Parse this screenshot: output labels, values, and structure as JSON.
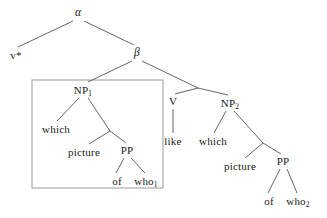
{
  "diagram": {
    "type": "syntax-tree",
    "width": 327,
    "height": 218,
    "background_color": "#ffffff",
    "line_color": "#555555",
    "box_color": "#999999",
    "text_color": "#1a1a1a"
  },
  "nodes": {
    "alpha": {
      "label": "α",
      "x": 78,
      "y": 13
    },
    "v_star": {
      "label": "v*",
      "x": 16,
      "y": 55
    },
    "beta": {
      "label": "β",
      "x": 137,
      "y": 53
    },
    "np1": {
      "label": "NP",
      "sub": "1",
      "x": 83,
      "y": 90
    },
    "which_left": {
      "label": "which",
      "x": 56,
      "y": 129
    },
    "picture_left": {
      "label": "picture",
      "x": 84,
      "y": 152
    },
    "pp_left": {
      "label": "PP",
      "x": 127,
      "y": 150
    },
    "of_left": {
      "label": "of",
      "x": 117,
      "y": 181
    },
    "who1": {
      "label": "who",
      "sub": "1",
      "x": 146,
      "y": 181
    },
    "v": {
      "label": "V",
      "x": 173,
      "y": 101
    },
    "like": {
      "label": "like",
      "x": 173,
      "y": 141
    },
    "np2": {
      "label": "NP",
      "sub": "2",
      "x": 230,
      "y": 103
    },
    "which_right": {
      "label": "which",
      "x": 213,
      "y": 141
    },
    "picture_right": {
      "label": "picture",
      "x": 240,
      "y": 166
    },
    "pp_right": {
      "label": "PP",
      "x": 283,
      "y": 161
    },
    "of_right": {
      "label": "of",
      "x": 269,
      "y": 201
    },
    "who2": {
      "label": "who",
      "sub": "2",
      "x": 298,
      "y": 201
    }
  },
  "edges": [
    {
      "from": "alpha",
      "to": "v_star",
      "x1": 73,
      "y1": 21,
      "x2": 18,
      "y2": 47
    },
    {
      "from": "alpha",
      "to": "beta",
      "x1": 84,
      "y1": 21,
      "x2": 134,
      "y2": 45
    },
    {
      "from": "beta",
      "to": "np1",
      "x1": 132,
      "y1": 61,
      "x2": 88,
      "y2": 82
    },
    {
      "from": "beta",
      "to": "vp",
      "x1": 142,
      "y1": 61,
      "x2": 198,
      "y2": 88
    },
    {
      "from": "vp",
      "to": "v",
      "x1": 198,
      "y1": 88,
      "x2": 175,
      "y2": 94
    },
    {
      "from": "vp",
      "to": "np2",
      "x1": 198,
      "y1": 88,
      "x2": 228,
      "y2": 95
    },
    {
      "from": "np1",
      "to": "which_left",
      "x1": 79,
      "y1": 98,
      "x2": 57,
      "y2": 121
    },
    {
      "from": "np1",
      "to": "nbar_left",
      "x1": 88,
      "y1": 98,
      "x2": 110,
      "y2": 131
    },
    {
      "from": "nbar_left",
      "to": "picture_left",
      "x1": 110,
      "y1": 131,
      "x2": 89,
      "y2": 144
    },
    {
      "from": "nbar_left",
      "to": "pp_left",
      "x1": 110,
      "y1": 131,
      "x2": 126,
      "y2": 143
    },
    {
      "from": "pp_left",
      "to": "of_left",
      "x1": 124,
      "y1": 158,
      "x2": 116,
      "y2": 173
    },
    {
      "from": "pp_left",
      "to": "who1",
      "x1": 131,
      "y1": 158,
      "x2": 145,
      "y2": 173
    },
    {
      "from": "v",
      "to": "like",
      "x1": 173,
      "y1": 109,
      "x2": 173,
      "y2": 133
    },
    {
      "from": "np2",
      "to": "which_right",
      "x1": 226,
      "y1": 111,
      "x2": 214,
      "y2": 133
    },
    {
      "from": "np2",
      "to": "nbar_right",
      "x1": 234,
      "y1": 111,
      "x2": 263,
      "y2": 143
    },
    {
      "from": "nbar_right",
      "to": "picture_right",
      "x1": 263,
      "y1": 143,
      "x2": 245,
      "y2": 158
    },
    {
      "from": "nbar_right",
      "to": "pp_right",
      "x1": 263,
      "y1": 143,
      "x2": 281,
      "y2": 154
    },
    {
      "from": "pp_right",
      "to": "of_right",
      "x1": 280,
      "y1": 169,
      "x2": 268,
      "y2": 193
    },
    {
      "from": "pp_right",
      "to": "who2",
      "x1": 287,
      "y1": 169,
      "x2": 297,
      "y2": 193
    }
  ],
  "selection_box": {
    "name": "np1-subtree-box",
    "x": 32,
    "y": 80,
    "width": 131,
    "height": 108
  }
}
